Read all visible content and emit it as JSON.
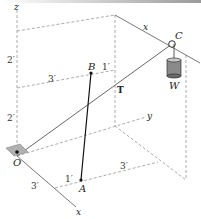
{
  "diagram": {
    "title": "",
    "axes": {
      "x": "x",
      "y": "y",
      "z": "z"
    },
    "points": {
      "origin": "O",
      "A": "A",
      "B": "B",
      "C": "C"
    },
    "force": "T",
    "weight": "W",
    "dimensions": {
      "z_lower": "2′",
      "z_upper": "2′",
      "B_offset_x": "3′",
      "B_offset_1": "1′",
      "A_offset_x": "3′",
      "A_offset_1": "1′",
      "A_offset_y": "3′"
    },
    "colors": {
      "line": "#333333",
      "dashed": "#888888",
      "base_plate": "#b0b0b0",
      "weight": "#7a7a7a"
    }
  }
}
